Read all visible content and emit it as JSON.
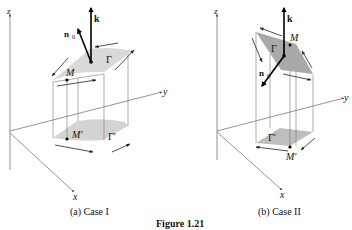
{
  "figure": {
    "title": "Figure 1.21",
    "panels": [
      {
        "caption": "(a)  Case  I",
        "labels": {
          "z": "z",
          "y": "y",
          "x": "x",
          "k": "k",
          "n0": "n",
          "n0_sub": "0",
          "M": "M",
          "Gamma": "Γ",
          "M_prime": "M′",
          "Gamma_prime": "Γ′"
        }
      },
      {
        "caption": "(b)  Case  II",
        "labels": {
          "z": "z",
          "y": "y",
          "x": "x",
          "k": "k",
          "n0": "n",
          "n0_sub": "0",
          "M": "M",
          "Gamma": "Γ",
          "M_prime": "M′",
          "Gamma_prime": "Γ′"
        }
      }
    ],
    "colors": {
      "surface_a": "#d9d9d9",
      "surface_b": "#a9a9a9",
      "projection": "#cfcfcf",
      "line": "#555555",
      "ink": "#111111"
    }
  }
}
